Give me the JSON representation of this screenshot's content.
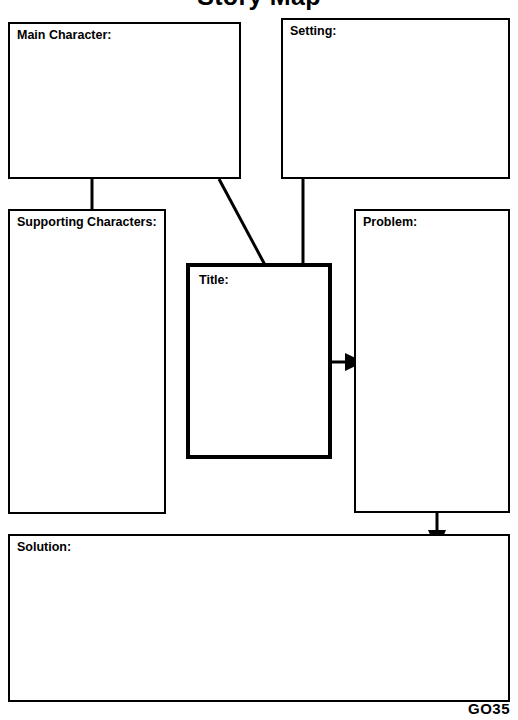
{
  "document": {
    "title_partial": "Story Map",
    "footer_code": "GO35"
  },
  "boxes": {
    "main_character": {
      "label": "Main Character:",
      "value": ""
    },
    "setting": {
      "label": "Setting:",
      "value": ""
    },
    "supporting_characters": {
      "label": "Supporting Characters:",
      "value": ""
    },
    "title": {
      "label": "Title:",
      "value": ""
    },
    "problem": {
      "label": "Problem:",
      "value": ""
    },
    "solution": {
      "label": "Solution:",
      "value": ""
    }
  },
  "connectors": {
    "main_to_supporting": "vertical-line",
    "main_to_title": "diagonal-line",
    "setting_to_problem": "vertical-line",
    "title_to_problem": "arrow-right",
    "problem_to_solution": "arrow-down"
  },
  "colors": {
    "ink": "#000000",
    "paper": "#ffffff"
  }
}
